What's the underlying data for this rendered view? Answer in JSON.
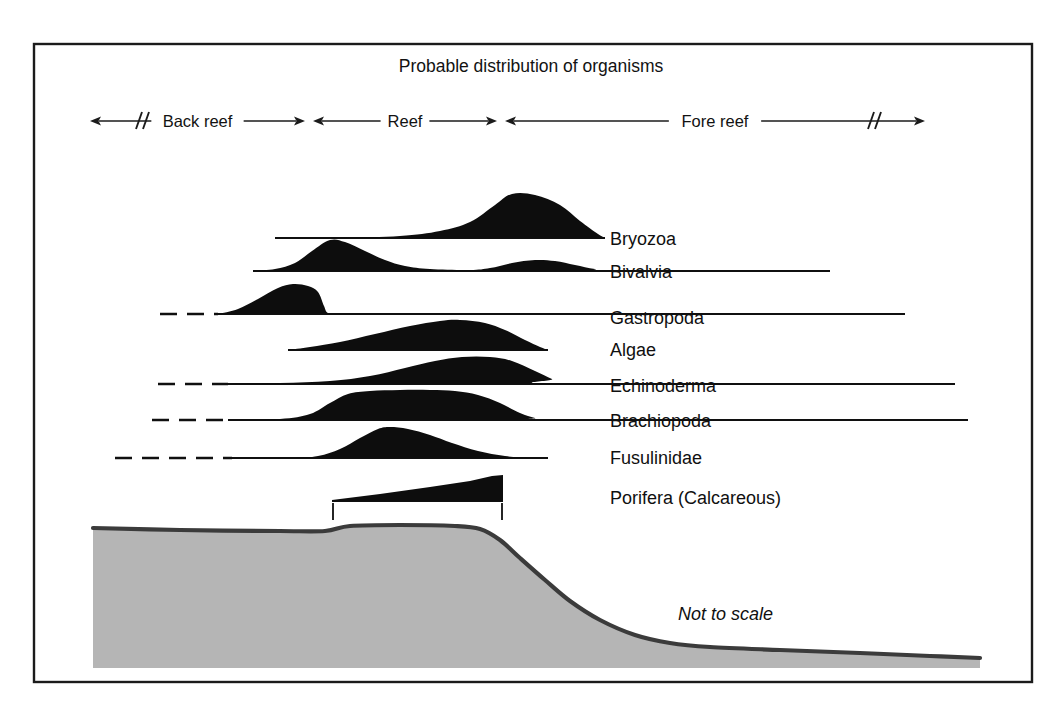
{
  "figure": {
    "title": "Probable distribution of organisms",
    "scale_note": "Not to scale",
    "background_color": "#ffffff",
    "frame_color": "#1b1b1b",
    "curve_color": "#0d0d0d",
    "seafloor_fill_color": "#b5b5b5",
    "seafloor_line_color": "#3b3b3b"
  },
  "zones": [
    {
      "label": "Back reef",
      "x_start": 90,
      "x_end": 305,
      "break_at": 140,
      "break_side": "left"
    },
    {
      "label": "Reef",
      "x_start": 313,
      "x_end": 497,
      "break_at": null,
      "break_side": null
    },
    {
      "label": "Fore reef",
      "x_start": 505,
      "x_end": 925,
      "break_at": 872,
      "break_side": "right"
    }
  ],
  "zone_axis_y": 121,
  "organisms": [
    {
      "name": "Bryozoa",
      "label_x": 610,
      "label_y": 245,
      "baseline_y": 238,
      "baseline_x_start": 275,
      "baseline_x_end": 605,
      "dashed_x_start": null,
      "dashed_x_end": null,
      "peak_x": 512,
      "peak_height": 44,
      "abundance_profile": [
        [
          275,
          0
        ],
        [
          340,
          0
        ],
        [
          400,
          2
        ],
        [
          440,
          7
        ],
        [
          470,
          16
        ],
        [
          495,
          33
        ],
        [
          512,
          44
        ],
        [
          535,
          43
        ],
        [
          560,
          33
        ],
        [
          580,
          17
        ],
        [
          598,
          4
        ],
        [
          605,
          0
        ]
      ]
    },
    {
      "name": "Bivalvia",
      "label_x": 610,
      "label_y": 278,
      "baseline_y": 271,
      "baseline_x_start": 253,
      "baseline_x_end": 830,
      "dashed_x_start": null,
      "dashed_x_end": null,
      "peak_x": 330,
      "peak_height": 31,
      "abundance_profile": [
        [
          253,
          0
        ],
        [
          275,
          2
        ],
        [
          295,
          8
        ],
        [
          312,
          20
        ],
        [
          330,
          31
        ],
        [
          345,
          29
        ],
        [
          365,
          20
        ],
        [
          385,
          11
        ],
        [
          405,
          5
        ],
        [
          430,
          2
        ],
        [
          470,
          1
        ],
        [
          490,
          3
        ],
        [
          512,
          8
        ],
        [
          535,
          11
        ],
        [
          555,
          10
        ],
        [
          575,
          6
        ],
        [
          595,
          2
        ],
        [
          615,
          0
        ],
        [
          830,
          0
        ]
      ]
    },
    {
      "name": "Gastropoda",
      "label_x": 610,
      "label_y": 324,
      "baseline_y": 314,
      "baseline_x_start": 218,
      "baseline_x_end": 905,
      "dashed_x_start": 160,
      "dashed_x_end": 218,
      "peak_x": 293,
      "peak_height": 30,
      "abundance_profile": [
        [
          218,
          0
        ],
        [
          238,
          5
        ],
        [
          258,
          15
        ],
        [
          278,
          26
        ],
        [
          293,
          30
        ],
        [
          308,
          28
        ],
        [
          318,
          22
        ],
        [
          324,
          8
        ],
        [
          328,
          1
        ],
        [
          340,
          0
        ],
        [
          905,
          0
        ]
      ]
    },
    {
      "name": "Algae",
      "label_x": 610,
      "label_y": 356,
      "baseline_y": 350,
      "baseline_x_start": 288,
      "baseline_x_end": 548,
      "dashed_x_start": null,
      "dashed_x_end": null,
      "peak_x": 452,
      "peak_height": 30,
      "abundance_profile": [
        [
          288,
          0
        ],
        [
          310,
          3
        ],
        [
          340,
          8
        ],
        [
          375,
          16
        ],
        [
          410,
          24
        ],
        [
          440,
          29
        ],
        [
          460,
          30
        ],
        [
          485,
          27
        ],
        [
          505,
          20
        ],
        [
          525,
          10
        ],
        [
          540,
          3
        ],
        [
          548,
          0
        ]
      ]
    },
    {
      "name": "Echinoderma",
      "label_x": 610,
      "label_y": 392,
      "baseline_y": 384,
      "baseline_x_start": 228,
      "baseline_x_end": 955,
      "dashed_x_start": 158,
      "dashed_x_end": 228,
      "peak_x": 480,
      "peak_height": 27,
      "abundance_profile": [
        [
          228,
          0
        ],
        [
          280,
          1
        ],
        [
          330,
          3
        ],
        [
          370,
          8
        ],
        [
          405,
          16
        ],
        [
          435,
          23
        ],
        [
          462,
          27
        ],
        [
          490,
          27
        ],
        [
          512,
          23
        ],
        [
          535,
          13
        ],
        [
          552,
          5
        ],
        [
          565,
          0
        ],
        [
          955,
          0
        ]
      ]
    },
    {
      "name": "Brachiopoda",
      "label_x": 610,
      "label_y": 427,
      "baseline_y": 420,
      "baseline_x_start": 228,
      "baseline_x_end": 968,
      "dashed_x_start": 152,
      "dashed_x_end": 228,
      "peak_x": 420,
      "peak_height": 30,
      "abundance_profile": [
        [
          228,
          0
        ],
        [
          280,
          1
        ],
        [
          310,
          6
        ],
        [
          330,
          17
        ],
        [
          348,
          26
        ],
        [
          370,
          29
        ],
        [
          400,
          30
        ],
        [
          430,
          30
        ],
        [
          455,
          29
        ],
        [
          478,
          25
        ],
        [
          500,
          17
        ],
        [
          520,
          7
        ],
        [
          535,
          2
        ],
        [
          548,
          0
        ],
        [
          968,
          0
        ]
      ]
    },
    {
      "name": "Fusulinidae",
      "label_x": 610,
      "label_y": 464,
      "baseline_y": 458,
      "baseline_x_start": 232,
      "baseline_x_end": 548,
      "dashed_x_start": 115,
      "dashed_x_end": 232,
      "peak_x": 388,
      "peak_height": 31,
      "abundance_profile": [
        [
          232,
          0
        ],
        [
          290,
          0
        ],
        [
          318,
          2
        ],
        [
          340,
          9
        ],
        [
          360,
          20
        ],
        [
          378,
          29
        ],
        [
          390,
          31
        ],
        [
          408,
          29
        ],
        [
          430,
          23
        ],
        [
          452,
          15
        ],
        [
          478,
          7
        ],
        [
          505,
          2
        ],
        [
          528,
          0
        ],
        [
          548,
          0
        ]
      ]
    },
    {
      "name": "Porifera (Calcareous)",
      "label_x": 610,
      "label_y": 504,
      "baseline_y": 501,
      "baseline_x_start": 332,
      "baseline_x_end": 503,
      "dashed_x_start": null,
      "dashed_x_end": null,
      "peak_x": 503,
      "peak_height": 26,
      "shape": "wedge",
      "tick_x_left": 333,
      "tick_x_right": 502,
      "tick_y_top": 503,
      "tick_y_bottom": 520,
      "abundance_profile": [
        [
          332,
          1
        ],
        [
          380,
          7
        ],
        [
          430,
          14
        ],
        [
          470,
          20
        ],
        [
          492,
          25
        ],
        [
          503,
          26
        ],
        [
          503,
          0
        ],
        [
          332,
          0
        ]
      ]
    }
  ],
  "seafloor": {
    "profile": [
      [
        93,
        528
      ],
      [
        180,
        530
      ],
      [
        280,
        531
      ],
      [
        325,
        531
      ],
      [
        350,
        526
      ],
      [
        400,
        525
      ],
      [
        455,
        526
      ],
      [
        480,
        529
      ],
      [
        500,
        540
      ],
      [
        520,
        558
      ],
      [
        545,
        580
      ],
      [
        570,
        601
      ],
      [
        600,
        620
      ],
      [
        635,
        635
      ],
      [
        670,
        643
      ],
      [
        710,
        647
      ],
      [
        780,
        650
      ],
      [
        860,
        653
      ],
      [
        930,
        656
      ],
      [
        980,
        658
      ]
    ],
    "bottom_y": 668,
    "left_x": 93,
    "right_x": 980
  },
  "frame": {
    "x": 34,
    "y": 44,
    "width": 998,
    "height": 638
  }
}
